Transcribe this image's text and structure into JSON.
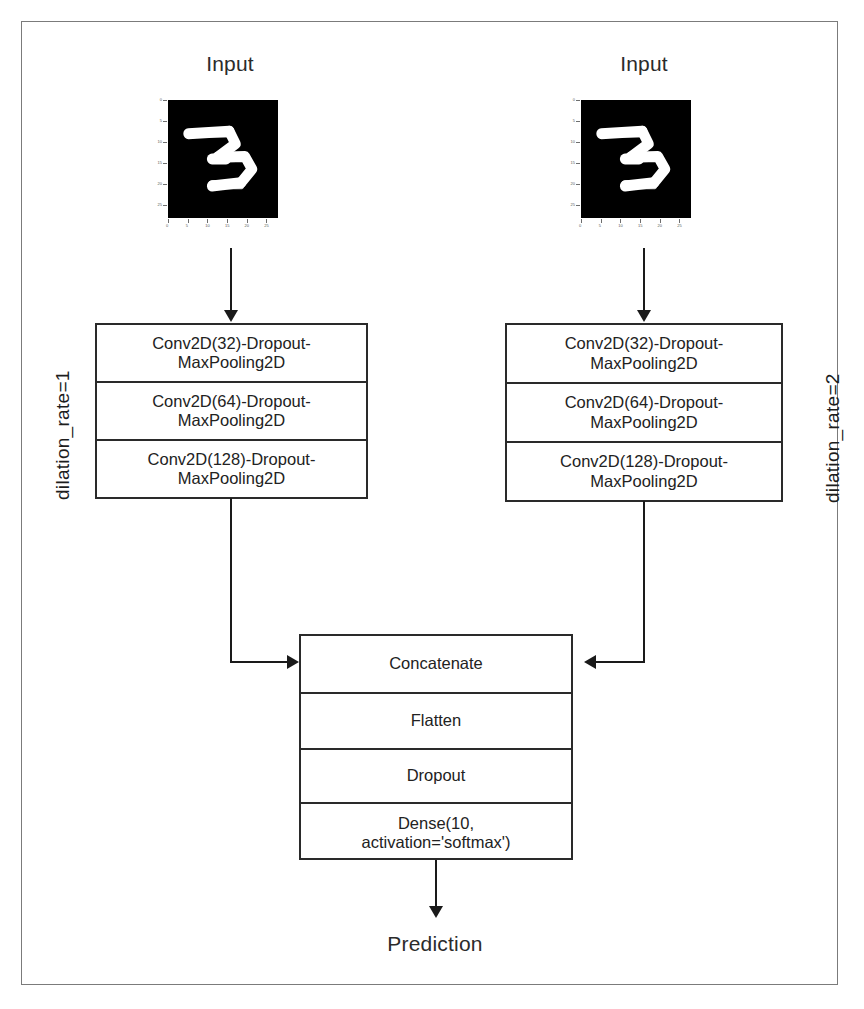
{
  "diagram": {
    "frame": {
      "border_color": "#7b7b7b"
    },
    "branches": [
      {
        "id": "left",
        "input_label": "Input",
        "side_label": "dilation_rate=1",
        "layers": [
          "Conv2D(32)-Dropout-MaxPooling2D",
          "Conv2D(64)-Dropout-MaxPooling2D",
          "Conv2D(128)-Dropout-MaxPooling2D"
        ],
        "layers_line1": [
          "Conv2D(32)-Dropout-",
          "Conv2D(64)-Dropout-",
          "Conv2D(128)-Dropout-"
        ],
        "layers_line2": [
          "MaxPooling2D",
          "MaxPooling2D",
          "MaxPooling2D"
        ]
      },
      {
        "id": "right",
        "input_label": "Input",
        "side_label": "dilation_rate=2",
        "layers": [
          "Conv2D(32)-Dropout-MaxPooling2D",
          "Conv2D(64)-Dropout-MaxPooling2D",
          "Conv2D(128)-Dropout-MaxPooling2D"
        ],
        "layers_line1": [
          "Conv2D(32)-Dropout-",
          "Conv2D(64)-Dropout-",
          "Conv2D(128)-Dropout-"
        ],
        "layers_line2": [
          "MaxPooling2D",
          "MaxPooling2D",
          "MaxPooling2D"
        ]
      }
    ],
    "head": {
      "layers": [
        "Concatenate",
        "Flatten",
        "Dropout",
        "Dense(10, activation='softmax')"
      ],
      "dense_line1": "Dense(10,",
      "dense_line2": "activation='softmax')"
    },
    "output_label": "Prediction",
    "digit_image": {
      "description": "MNIST handwritten digit 3",
      "background": "#000000",
      "stroke": "#ffffff",
      "x_ticks": [
        "0",
        "5",
        "10",
        "15",
        "20",
        "25"
      ],
      "y_ticks": [
        "0",
        "5",
        "10",
        "15",
        "20",
        "25"
      ]
    }
  }
}
